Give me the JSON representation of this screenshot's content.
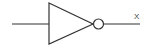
{
  "diagram": {
    "type": "logic-gate",
    "gate": "NOT",
    "output_label": "X",
    "stroke_color": "#333333",
    "background_color": "#ffffff"
  }
}
